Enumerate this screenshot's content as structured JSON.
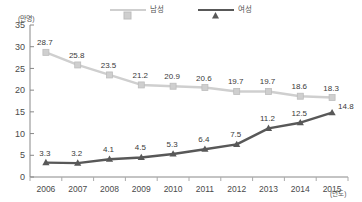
{
  "chart_data": {
    "type": "line",
    "title": "",
    "xlabel": "(년도)",
    "ylabel": "(만명)",
    "categories": [
      "2006",
      "2007",
      "2008",
      "2009",
      "2010",
      "2011",
      "2012",
      "2013",
      "2014",
      "2015"
    ],
    "ylim": [
      0,
      35
    ],
    "yticks": [
      "0",
      "5",
      "10",
      "15",
      "20",
      "25",
      "30",
      "35"
    ],
    "grid": false,
    "legend_position": "top-center",
    "series": [
      {
        "name": "남성",
        "color": "#cfcfcf",
        "marker": "square",
        "values": [
          28.7,
          25.8,
          23.5,
          21.2,
          20.9,
          20.6,
          19.7,
          19.7,
          18.6,
          18.3
        ],
        "labels": [
          "28.7",
          "25.8",
          "23.5",
          "21.2",
          "20.9",
          "20.6",
          "19.7",
          "19.7",
          "18.6",
          "18.3"
        ]
      },
      {
        "name": "여성",
        "color": "#585858",
        "marker": "triangle",
        "values": [
          3.3,
          3.2,
          4.1,
          4.5,
          5.3,
          6.4,
          7.5,
          11.2,
          12.5,
          14.8
        ],
        "labels": [
          "3.3",
          "3.2",
          "4.1",
          "4.5",
          "5.3",
          "6.4",
          "7.5",
          "11.2",
          "12.5",
          "14.8"
        ]
      }
    ]
  },
  "legend": {
    "entries": [
      {
        "label": "남성"
      },
      {
        "label": "여성"
      }
    ]
  },
  "axes": {
    "y_unit": "(만명)",
    "x_unit": "(년도)"
  }
}
